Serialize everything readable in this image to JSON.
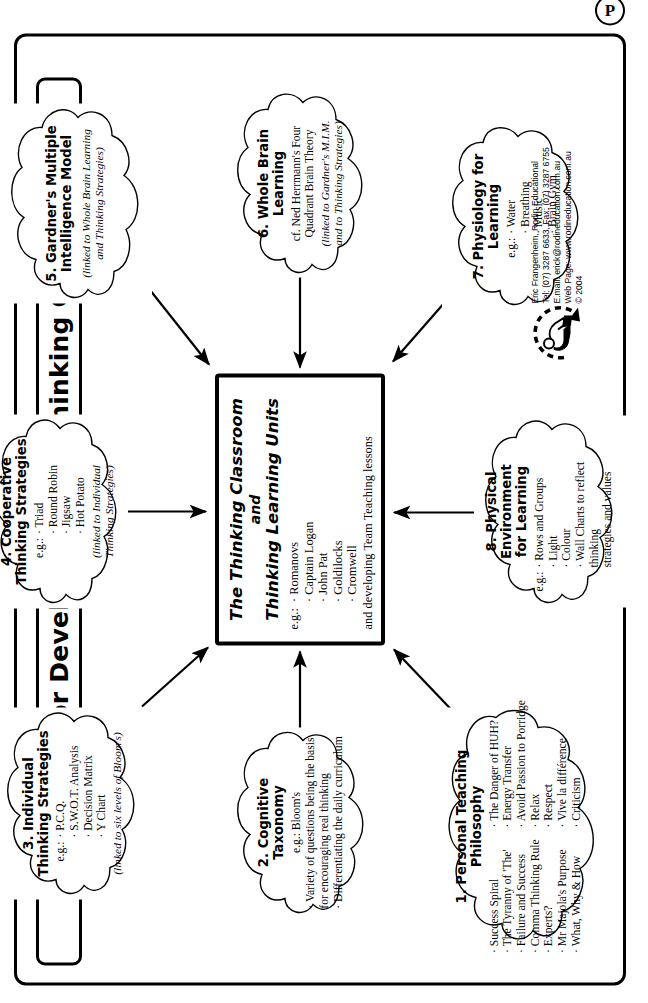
{
  "page": {
    "title": "Framework for Developing the “Thinking Classroom”",
    "badge": "P"
  },
  "center": {
    "title_line1": "The Thinking Classroom",
    "title_and": "and",
    "title_line2": "Thinking Learning Units",
    "eg_label": "e.g.:",
    "items": [
      "Romanovs",
      "Captain Logan",
      "John Pat",
      "Goldilocks",
      "Cromwell"
    ],
    "footer": "and developing Team Teaching lessons"
  },
  "clouds": [
    {
      "id": "cloud-1",
      "title": "1. Personal Teaching Philosophy",
      "column_left": [
        "Success Spiral",
        "The Tyranny of 'The'",
        "Failure and Success",
        "Comma Thinking Rule",
        "Experts?",
        "Mr Majola's Purpose",
        "What, Why & How"
      ],
      "column_right": [
        "The Danger of HUH?",
        "Energy Transfer",
        "Avoid Passion to Porridge",
        "Relax",
        "Respect",
        "Vive la différence",
        "Criticism"
      ]
    },
    {
      "id": "cloud-2",
      "title": "2. Cognitive Taxonomy",
      "lead": "e.g.: Bloom's",
      "items": [
        "Variety of questions being the basis\n  for encouraging real thinking",
        "Differentiating the daily curriculum"
      ]
    },
    {
      "id": "cloud-3",
      "title": "3. Individual\nThinking Strategies",
      "eg_label": "e.g.:",
      "items": [
        "P.C.Q.",
        "S.W.O.T. Analysis",
        "Decision Matrix",
        "Y Chart"
      ],
      "note": "(linked to six levels of Bloom's)"
    },
    {
      "id": "cloud-4",
      "title": "4. Cooperative\nThinking Strategies",
      "eg_label": "e.g.:",
      "items": [
        "Triad",
        "Round Robin",
        "Jigsaw",
        "Hot Potato"
      ],
      "note": "(linked to Individual\nThinking Strategies)"
    },
    {
      "id": "cloud-5",
      "title": "5. Gardner's Multiple\nIntelligence Model",
      "note": "(linked to Whole Brain Learning\nand Thinking Strategies)"
    },
    {
      "id": "cloud-6",
      "title": "6. Whole Brain Learning",
      "lines": "cf. Ned Herrmann's Four\nQuadrant Brain Theory",
      "note": "(linked to Gardner's M.I.M.\nand to Thinking Strategies)"
    },
    {
      "id": "cloud-7",
      "title": "7. Physiology for Learning",
      "eg_label": "e.g.:",
      "items": [
        "Water",
        "Breathing",
        "Music",
        "Brain Gym"
      ]
    },
    {
      "id": "cloud-8",
      "title": "8. Physical Environment\nfor Learning",
      "eg_label": "e.g.:",
      "items": [
        "Rows and Groups",
        "Light",
        "Colour",
        "Wall Charts to reflect thinking\n  strategies and values"
      ]
    }
  ],
  "credits": {
    "line1": "Eric Frangenheim, Rodin Educational",
    "line2": "Tel: (07) 3287 6633, Fax: (07) 3287 6755",
    "line3": "E.mail: erick@rodineducation.com.au",
    "line4": "Web Page: www.rodineducation.com.au",
    "line5": "© 2004"
  },
  "colors": {
    "ink": "#000000",
    "paper": "#ffffff"
  }
}
